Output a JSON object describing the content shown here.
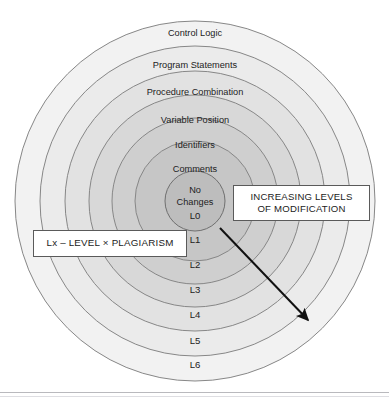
{
  "diagram": {
    "type": "concentric-rings",
    "center": {
      "x": 195,
      "y": 201
    },
    "rings": [
      {
        "level": "L6",
        "label": "Control Logic",
        "radius": 180,
        "fill": "#f2f2f2",
        "label_y": 36,
        "level_y": 368
      },
      {
        "level": "L5",
        "label": "Program Statements",
        "radius": 155,
        "fill": "#ebebeb",
        "label_y": 68,
        "level_y": 344
      },
      {
        "level": "L4",
        "label": "Procedure Combination",
        "radius": 130,
        "fill": "#e2e2e2",
        "label_y": 95,
        "level_y": 318
      },
      {
        "level": "L3",
        "label": "Variable Position",
        "radius": 106,
        "fill": "#d8d8d8",
        "label_y": 123,
        "level_y": 293
      },
      {
        "level": "L2",
        "label": "Identifiers",
        "radius": 83,
        "fill": "#cfcfcf",
        "label_y": 148,
        "level_y": 268
      },
      {
        "level": "L1",
        "label": "Comments",
        "radius": 60,
        "fill": "#c6c6c6",
        "label_y": 172,
        "level_y": 243
      },
      {
        "level": "L0",
        "label": "",
        "radius": 30,
        "fill": "#bdbdbd",
        "label_y": 0,
        "level_y": 212
      }
    ],
    "center_lines": [
      "No",
      "Changes",
      "L0"
    ],
    "stroke": "#808080"
  },
  "callouts": {
    "increasing": {
      "line1": "INCREASING LEVELS",
      "line2": "OF MODIFICATION"
    },
    "legend": "Lx – LEVEL × PLAGIARISM"
  },
  "arrow": {
    "name": "increasing-levels-arrow",
    "from": {
      "x": 220,
      "y": 228
    },
    "to": {
      "x": 313,
      "y": 325
    },
    "color": "#111111"
  }
}
